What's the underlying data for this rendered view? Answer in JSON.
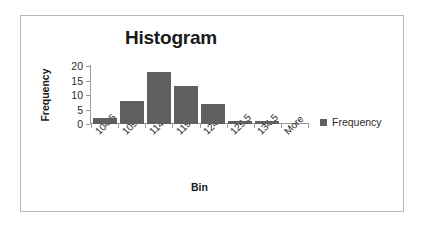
{
  "frame": {
    "border_color": "#b9b9b9",
    "background": "#ffffff"
  },
  "chart_data": {
    "type": "bar",
    "title": "Histogram",
    "xlabel": "Bin",
    "ylabel": "Frequency",
    "categories": [
      "104.5",
      "109.5",
      "114.5",
      "119.5",
      "124.5",
      "129.5",
      "134.5",
      "More"
    ],
    "values": [
      2,
      8,
      18,
      13,
      7,
      1,
      1,
      0
    ],
    "series": [
      {
        "name": "Frequency",
        "color": "#5f5f5f",
        "values": [
          2,
          8,
          18,
          13,
          7,
          1,
          1,
          0
        ]
      }
    ],
    "ylim": [
      0,
      20
    ],
    "yticks": [
      0,
      5,
      10,
      15,
      20
    ],
    "ytick_labels": [
      "0",
      "5",
      "10",
      "15",
      "20"
    ],
    "grid": false,
    "legend": {
      "position": "right",
      "entries": [
        {
          "label": "Frequency",
          "color": "#5f5f5f"
        }
      ]
    },
    "xtick_rotation": -45,
    "bar_color": "#5f5f5f",
    "axis_color": "#9a9a9a"
  }
}
